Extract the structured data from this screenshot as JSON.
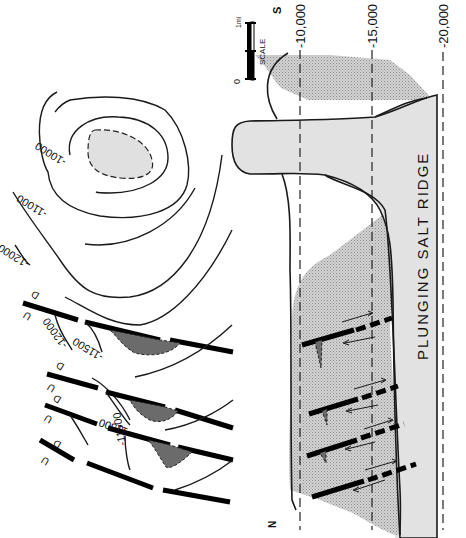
{
  "figure": {
    "type": "structural contour map and cross section",
    "orientation": "rotated 90 degrees clockwise",
    "map_view": {
      "contour_labels": [
        "-10000",
        "-11000",
        "-12000",
        "-12000",
        "-11500",
        "-11500",
        "-11500"
      ],
      "contours": {
        "c10000": "-10000",
        "c11000": "-11000",
        "c12000a": "-12000",
        "c12000b": "-12000",
        "c11500a": "-11500",
        "c11500b": "-11500",
        "c11500c": "-11500"
      },
      "fault_labels": {
        "up": "U",
        "down": "D"
      },
      "fault_count": 4,
      "trap_count": 3
    },
    "cross_section": {
      "title": "PLUNGING SALT RIDGE",
      "depth_labels": [
        "-10,000",
        "-15,000",
        "-20,000"
      ],
      "depths": {
        "d10000": "-10,000",
        "d15000": "-15,000",
        "d20000": "-20,000"
      },
      "direction_south": "S",
      "direction_north": "N",
      "fault_count": 4
    },
    "scale": {
      "label": "SCALE",
      "start": "0",
      "end": "1mi"
    },
    "colors": {
      "salt": "#e2e2e2",
      "trap": "#6b6b6b",
      "ink": "#000000",
      "background": "#ffffff"
    }
  }
}
